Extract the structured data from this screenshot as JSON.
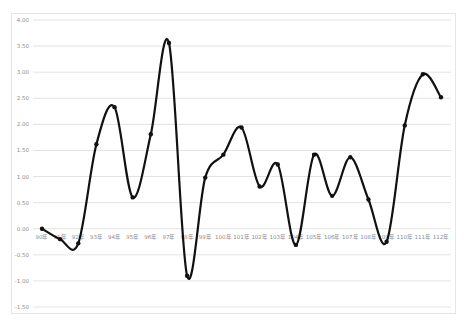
{
  "chart_data": {
    "type": "line",
    "title": "",
    "xlabel": "",
    "ylabel": "",
    "categories": [
      "90年",
      "91年",
      "92年",
      "93年",
      "94年",
      "95年",
      "96年",
      "97年",
      "98年",
      "99年",
      "100年",
      "101年",
      "102年",
      "103年",
      "104年",
      "105年",
      "106年",
      "107年",
      "108年",
      "109年",
      "110年",
      "111年",
      "112年"
    ],
    "series": [
      {
        "name": "Series 1",
        "values": [
          0.0,
          -0.2,
          -0.28,
          1.62,
          2.33,
          0.6,
          1.81,
          3.56,
          -0.9,
          0.98,
          1.42,
          1.94,
          0.81,
          1.23,
          -0.31,
          1.42,
          0.63,
          1.37,
          0.56,
          -0.25,
          1.98,
          2.96,
          2.52
        ],
        "color": "#111111",
        "smooth": true,
        "markers": true
      }
    ],
    "ylim": [
      -1.5,
      4.0
    ],
    "yticks": [
      "4.00",
      "3.50",
      "3.00",
      "2.50",
      "2.00",
      "1.50",
      "1.00",
      "0.50",
      "0.00",
      "-0.50",
      "-1.00",
      "-1.50"
    ],
    "grid": true,
    "legend": "none",
    "x_labels_position": "at zero line"
  }
}
